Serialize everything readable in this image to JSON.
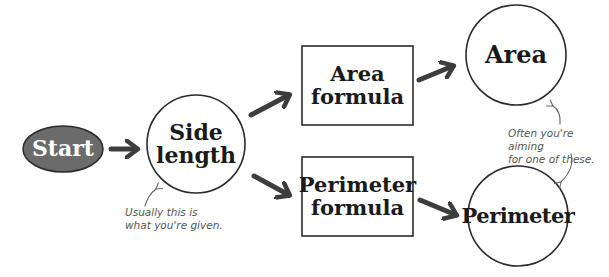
{
  "diagram": {
    "colors": {
      "start_fill": "#6b6b6b",
      "stroke": "#2b2b2b",
      "arrow": "#3d3d3d",
      "annotation": "#666666"
    },
    "nodes": {
      "start": {
        "label": "Start",
        "shape": "ellipse"
      },
      "side_length": {
        "label": "Side\nlength",
        "shape": "circle"
      },
      "area_formula": {
        "label": "Area\nformula",
        "shape": "rectangle"
      },
      "perimeter_formula": {
        "label": "Perimeter\nformula",
        "shape": "rectangle"
      },
      "area": {
        "label": "Area",
        "shape": "circle"
      },
      "perimeter": {
        "label": "Perimeter",
        "shape": "circle"
      }
    },
    "edges": [
      {
        "from": "start",
        "to": "side_length"
      },
      {
        "from": "side_length",
        "to": "area_formula"
      },
      {
        "from": "side_length",
        "to": "perimeter_formula"
      },
      {
        "from": "area_formula",
        "to": "area"
      },
      {
        "from": "perimeter_formula",
        "to": "perimeter"
      }
    ],
    "annotations": {
      "given": "Usually this is\nwhat you're given.",
      "aiming": "Often you're aiming\nfor one of these."
    }
  }
}
